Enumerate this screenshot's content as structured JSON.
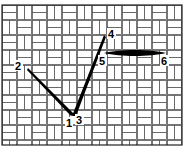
{
  "diagram": {
    "type": "needlepoint stitch diagram",
    "background": "basketweave canvas",
    "colors": {
      "stitch": "#000000",
      "canvas_line": "#555555",
      "canvas_fill": "#ffffff"
    },
    "points": [
      {
        "id": "1",
        "label": "1"
      },
      {
        "id": "2",
        "label": "2"
      },
      {
        "id": "3",
        "label": "3"
      },
      {
        "id": "4",
        "label": "4"
      },
      {
        "id": "5",
        "label": "5"
      },
      {
        "id": "6",
        "label": "6"
      }
    ],
    "stitches": [
      {
        "from": "2",
        "to": "1"
      },
      {
        "from": "3",
        "to": "4"
      },
      {
        "from": "5",
        "to": "6"
      }
    ]
  }
}
